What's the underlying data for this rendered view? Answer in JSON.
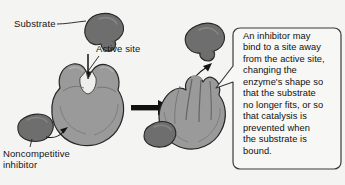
{
  "figure": {
    "background_color": "#f4f4f2"
  },
  "labels": {
    "substrate": "Substrate",
    "active_site": "Active site",
    "noncompetitive_inhibitor": "Noncompetitive\ninhibitor"
  },
  "callout": {
    "text": "An inhibitor may\nbind to a site away\nfrom the active site,\nchanging the\nenzyme's shape so\nthat the substrate\nno longer fits, or so\nthat catalysis is\nprevented when\nthe substrate is\nbound.",
    "border_color": "#3a3a3a",
    "fill_color": "#f7f7f5"
  },
  "colors": {
    "enzyme_fill": "#9a9a9a",
    "enzyme_shadow": "#8a8a8a",
    "enzyme_highlight": "#b4b4b4",
    "substrate_fill": "#6e6e6e",
    "inhibitor_fill": "#6e6e6e",
    "outline": "#2a2a2a",
    "arrow_black": "#111111",
    "active_site_notch": "#e8e8e6"
  },
  "shapes": {
    "substrate_top": "substrate-blob",
    "enzyme_left": "enzyme-with-open-active-site",
    "inhibitor_left": "inhibitor-blob",
    "enzyme_right": "deformed-enzyme-with-closed-active-site",
    "substrate_right": "rejected-substrate-blob",
    "inhibitor_right": "bound-inhibitor-blob"
  },
  "arrows": {
    "substrate_down": "downward-arrow-substrate-to-active-site",
    "transformation": "rightward-transformation-arrow",
    "inhibitor_pointer": "curved-arrow-inhibitor-to-enzyme",
    "substrate_rejected": "curved-arrow-substrate-rejected"
  }
}
